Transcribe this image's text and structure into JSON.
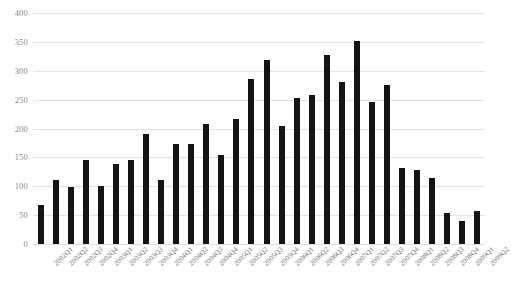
{
  "chart_data": {
    "type": "bar",
    "title": "",
    "subtitle": "",
    "xlabel": "",
    "ylabel": "",
    "ylim": [
      0,
      400
    ],
    "ytick_step": 50,
    "ytick_labels": [
      "0",
      "50",
      "100",
      "150",
      "200",
      "250",
      "300",
      "350",
      "400"
    ],
    "ytick_values": [
      0,
      50,
      100,
      150,
      200,
      250,
      300,
      350,
      400
    ],
    "grid": true,
    "grid_axis": "y",
    "legend": false,
    "legend_position": "none",
    "bar_color": "#141414",
    "grid_color": "#e4e4e4",
    "tick_label_color": "#8a8a8a",
    "xtick_rotation_degrees": -45,
    "categories": [
      "2002Q1",
      "2002Q2",
      "2002Q3",
      "2002Q4",
      "2003Q1",
      "2003Q2",
      "2003Q3",
      "2003Q4",
      "2004Q1",
      "2004Q2",
      "2004Q3",
      "2004Q4",
      "2005Q1",
      "2005Q2",
      "2005Q3",
      "2005Q4",
      "2006Q1",
      "2006Q2",
      "2006Q3",
      "2006Q4",
      "2007Q1",
      "2007Q2",
      "2007Q3",
      "2007Q4",
      "2008Q1",
      "2008Q2",
      "2008Q3",
      "2008Q4",
      "2009Q1",
      "2009Q2"
    ],
    "values": [
      68,
      111,
      99,
      146,
      101,
      138,
      145,
      190,
      110,
      174,
      174,
      208,
      154,
      216,
      285,
      318,
      205,
      253,
      258,
      327,
      281,
      351,
      246,
      275,
      131,
      129,
      115,
      53,
      40,
      58
    ],
    "series": [
      {
        "name": "",
        "values": [
          68,
          111,
          99,
          146,
          101,
          138,
          145,
          190,
          110,
          174,
          174,
          208,
          154,
          216,
          285,
          318,
          205,
          253,
          258,
          327,
          281,
          351,
          246,
          275,
          131,
          129,
          115,
          53,
          40,
          58
        ]
      }
    ]
  }
}
